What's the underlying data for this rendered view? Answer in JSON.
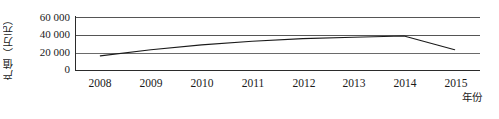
{
  "chart_data": {
    "type": "line",
    "title": "",
    "subtitle": "",
    "xlabel": "年份",
    "ylabel": "产值（万元）",
    "categories": [
      "2008",
      "2009",
      "2010",
      "2011",
      "2012",
      "2013",
      "2014",
      "2015"
    ],
    "x": [
      2008,
      2009,
      2010,
      2011,
      2012,
      2013,
      2014,
      2015
    ],
    "series": [
      {
        "name": "产值",
        "values": [
          16000,
          23000,
          28500,
          32500,
          35500,
          37000,
          38500,
          23000
        ]
      }
    ],
    "values": [
      16000,
      23000,
      28500,
      32500,
      35500,
      37000,
      38500,
      23000
    ],
    "ylim": [
      0,
      60000
    ],
    "yticks": [
      0,
      20000,
      40000,
      60000
    ],
    "ytick_labels": [
      "0",
      "20 000",
      "40 000",
      "60 000"
    ],
    "xtick_labels": [
      "2008",
      "2009",
      "2010",
      "2011",
      "2012",
      "2013",
      "2014",
      "2015"
    ],
    "grid": true,
    "grid_axis": "y",
    "legend": false,
    "legend_position": "none",
    "line_color": "#1a1a1a",
    "grid_color": "#5a5a5a",
    "axis_color": "#1a1a1a",
    "background_color": "#ffffff",
    "markers": false,
    "annotations": []
  },
  "axis": {
    "y_title": "产值（万元）",
    "x_title": "年份",
    "y_labels": [
      {
        "value": 60000,
        "text": "60 000"
      },
      {
        "value": 40000,
        "text": "40 000"
      },
      {
        "value": 20000,
        "text": "20 000"
      },
      {
        "value": 0,
        "text": "0"
      }
    ],
    "x_labels": [
      {
        "value": 2008,
        "text": "2008"
      },
      {
        "value": 2009,
        "text": "2009"
      },
      {
        "value": 2010,
        "text": "2010"
      },
      {
        "value": 2011,
        "text": "2011"
      },
      {
        "value": 2012,
        "text": "2012"
      },
      {
        "value": 2013,
        "text": "2013"
      },
      {
        "value": 2014,
        "text": "2014"
      },
      {
        "value": 2015,
        "text": "2015"
      }
    ]
  }
}
